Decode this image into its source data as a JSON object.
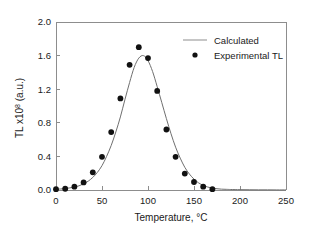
{
  "chart_data": {
    "type": "line",
    "title": "",
    "xlabel": "Temperature, °C",
    "ylabel_main": "TL x10",
    "ylabel_exponent": "8",
    "ylabel_units": " (a.u.)",
    "xlim": [
      0,
      250
    ],
    "ylim": [
      0.0,
      2.0
    ],
    "xticks": [
      0,
      50,
      100,
      150,
      200,
      250
    ],
    "xtick_labels": [
      "0",
      "50",
      "100",
      "150",
      "200",
      "250"
    ],
    "yticks": [
      0.0,
      0.4,
      0.8,
      1.2,
      1.6,
      2.0
    ],
    "ytick_labels": [
      "0.0",
      "0.4",
      "0.8",
      "1.2",
      "1.6",
      "2.0"
    ],
    "grid": false,
    "legend_position": "top-right",
    "legend": [
      {
        "label": "Calculated",
        "marker": "line",
        "color": "#6f6f6f"
      },
      {
        "label": "Experimental TL",
        "marker": "dot",
        "color": "#111111"
      }
    ],
    "series": [
      {
        "name": "Calculated",
        "type": "line",
        "color": "#6f6f6f",
        "x": [
          0,
          5,
          10,
          15,
          20,
          25,
          30,
          35,
          40,
          45,
          50,
          55,
          60,
          65,
          70,
          75,
          80,
          85,
          90,
          95,
          100,
          105,
          110,
          115,
          120,
          125,
          130,
          135,
          140,
          145,
          150,
          155,
          160,
          165,
          170,
          175,
          180,
          185,
          190,
          200,
          210,
          220,
          230,
          240,
          250
        ],
        "y": [
          0.01,
          0.012,
          0.018,
          0.025,
          0.035,
          0.05,
          0.075,
          0.105,
          0.15,
          0.21,
          0.29,
          0.4,
          0.53,
          0.69,
          0.87,
          1.08,
          1.28,
          1.46,
          1.57,
          1.6,
          1.54,
          1.41,
          1.23,
          1.04,
          0.85,
          0.67,
          0.51,
          0.38,
          0.27,
          0.19,
          0.13,
          0.085,
          0.055,
          0.035,
          0.022,
          0.015,
          0.01,
          0.008,
          0.006,
          0.004,
          0.003,
          0.002,
          0.002,
          0.001,
          0.001
        ]
      },
      {
        "name": "Experimental TL",
        "type": "scatter",
        "color": "#111111",
        "x": [
          0,
          10,
          20,
          30,
          40,
          50,
          60,
          70,
          80,
          90,
          100,
          110,
          120,
          130,
          140,
          150,
          160,
          170
        ],
        "y": [
          0.01,
          0.015,
          0.04,
          0.09,
          0.21,
          0.395,
          0.69,
          1.09,
          1.49,
          1.7,
          1.57,
          1.18,
          0.72,
          0.395,
          0.195,
          0.095,
          0.04,
          0.01
        ]
      }
    ]
  },
  "figure": {
    "background": "#ffffff",
    "axis_color": "#8d8d8d"
  }
}
